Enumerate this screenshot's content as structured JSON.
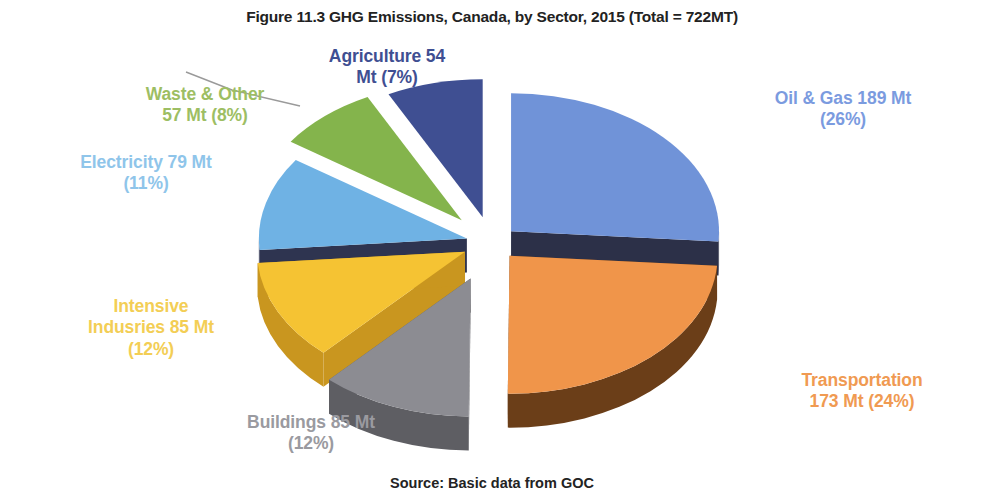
{
  "chart_data": {
    "type": "pie",
    "title": "Figure 11.3 GHG Emissions, Canada, by Sector, 2015 (Total = 722MT)",
    "source": "Source: Basic data from GOC",
    "total_mt": 722,
    "unit": "Mt",
    "exploded": true,
    "three_d": true,
    "legend": "none",
    "categories": [
      "Oil & Gas",
      "Transportation",
      "Buildings",
      "Intensive Indusries",
      "Electricity",
      "Waste & Other",
      "Agriculture"
    ],
    "values": [
      189,
      173,
      85,
      85,
      79,
      57,
      54
    ],
    "percentages": [
      26,
      24,
      12,
      12,
      11,
      8,
      7
    ],
    "colors": [
      "#7093D8",
      "#F0954A",
      "#8C8C92",
      "#F5C333",
      "#6FB2E4",
      "#84B44C",
      "#3F4F92"
    ],
    "side_colors": [
      "#2B2F४5",
      "#6B3E18",
      "#5E5E63",
      "#C9961F",
      "#2E3450",
      "#49562B",
      "#20243A"
    ],
    "slices": [
      {
        "name": "Oil & Gas",
        "value": 189,
        "percent": 26,
        "color": "#7093D8",
        "side": "#2C3048",
        "label": "Oil & Gas 189 Mt\n(26%)",
        "label_color": "#7B9BDF"
      },
      {
        "name": "Transportation",
        "value": 173,
        "percent": 24,
        "color": "#F0954A",
        "side": "#6B3E18",
        "label": "Transportation\n173 Mt (24%)",
        "label_color": "#F09A52"
      },
      {
        "name": "Buildings",
        "value": 85,
        "percent": 12,
        "color": "#8C8C92",
        "side": "#5E5E63",
        "label": "Buildings 85 Mt\n(12%)",
        "label_color": "#9A9AA0"
      },
      {
        "name": "Intensive Indusries",
        "value": 85,
        "percent": 12,
        "color": "#F5C333",
        "side": "#C9961F",
        "label": "Intensive\nIndusries 85 Mt\n(12%)",
        "label_color": "#F3CE55"
      },
      {
        "name": "Electricity",
        "value": 79,
        "percent": 11,
        "color": "#6FB2E4",
        "side": "#2E3450",
        "label": "Electricity 79 Mt\n(11%)",
        "label_color": "#8FC5EA"
      },
      {
        "name": "Waste & Other",
        "value": 57,
        "percent": 8,
        "color": "#84B44C",
        "side": "#49562B",
        "label": "Waste & Other\n57 Mt (8%)",
        "label_color": "#9DBE63"
      },
      {
        "name": "Agriculture",
        "value": 54,
        "percent": 7,
        "color": "#3F4F92",
        "side": "#20243A",
        "label": "Agriculture 54\nMt (7%)",
        "label_color": "#3F4F92"
      }
    ]
  }
}
